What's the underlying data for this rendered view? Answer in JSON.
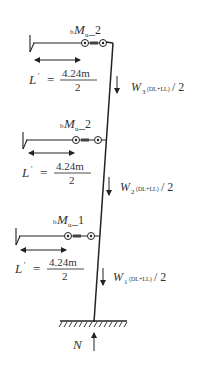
{
  "diagram": {
    "levels": [
      {
        "moment_prefix": "b",
        "moment_symbol": "M",
        "moment_sub": "u",
        "moment_suffix": "_2",
        "length_symbol": "L",
        "length_prime": "'",
        "equals": "=",
        "length_numerator": "4.24m",
        "length_denominator": "2",
        "load_symbol": "W",
        "load_index": "3",
        "load_sub": "(DL+LL)",
        "load_suffix": "/ 2"
      },
      {
        "moment_prefix": "b",
        "moment_symbol": "M",
        "moment_sub": "u",
        "moment_suffix": "_2",
        "length_symbol": "L",
        "length_prime": "'",
        "equals": "=",
        "length_numerator": "4.24m",
        "length_denominator": "2",
        "load_symbol": "W",
        "load_index": "2",
        "load_sub": "(DL+LL)",
        "load_suffix": "/ 2"
      },
      {
        "moment_prefix": "b",
        "moment_symbol": "M",
        "moment_sub": "u",
        "moment_suffix": "_1",
        "length_symbol": "L",
        "length_prime": "'",
        "equals": "=",
        "length_numerator": "4.24m",
        "length_denominator": "2",
        "load_symbol": "W",
        "load_index": "1",
        "load_sub": "(DL+LL)",
        "load_suffix": "/ 2"
      }
    ],
    "reaction_label": "N",
    "colors": {
      "line": "#222222",
      "text": "#333333",
      "background": "#ffffff"
    }
  }
}
